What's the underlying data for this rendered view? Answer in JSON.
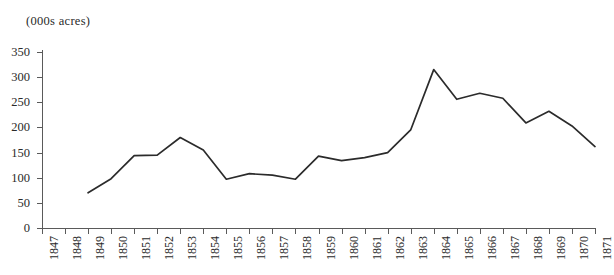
{
  "chart_data": {
    "type": "line",
    "title": "(000s acres)",
    "xlabel": "",
    "ylabel": "",
    "categories": [
      "1847",
      "1848",
      "1849",
      "1850",
      "1851",
      "1852",
      "1853",
      "1854",
      "1855",
      "1856",
      "1857",
      "1858",
      "1859",
      "1860",
      "1861",
      "1862",
      "1863",
      "1864",
      "1865",
      "1866",
      "1867",
      "1868",
      "1869",
      "1870",
      "1871"
    ],
    "values": [
      null,
      null,
      70,
      98,
      144,
      145,
      180,
      155,
      97,
      108,
      105,
      97,
      143,
      134,
      140,
      150,
      195,
      315,
      256,
      268,
      258,
      209,
      232,
      203,
      162
    ],
    "series": [
      {
        "name": "acreage",
        "values": [
          null,
          null,
          70,
          98,
          144,
          145,
          180,
          155,
          97,
          108,
          105,
          97,
          143,
          134,
          140,
          150,
          195,
          315,
          256,
          268,
          258,
          209,
          232,
          203,
          162
        ]
      }
    ],
    "yticks": [
      0,
      50,
      100,
      150,
      200,
      250,
      300,
      350
    ],
    "ytick_labels": [
      "0",
      "50",
      "100",
      "150",
      "200",
      "250",
      "300",
      "350"
    ],
    "ylim": [
      0,
      350
    ],
    "xlim": [
      "1847",
      "1871"
    ],
    "grid": false,
    "legend": null,
    "legend_position": "none",
    "line_color": "#2b2b2b",
    "axis_color": "#5a5a5a",
    "background_color": "#ffffff",
    "xtick_rotation": -90,
    "annotations": []
  }
}
